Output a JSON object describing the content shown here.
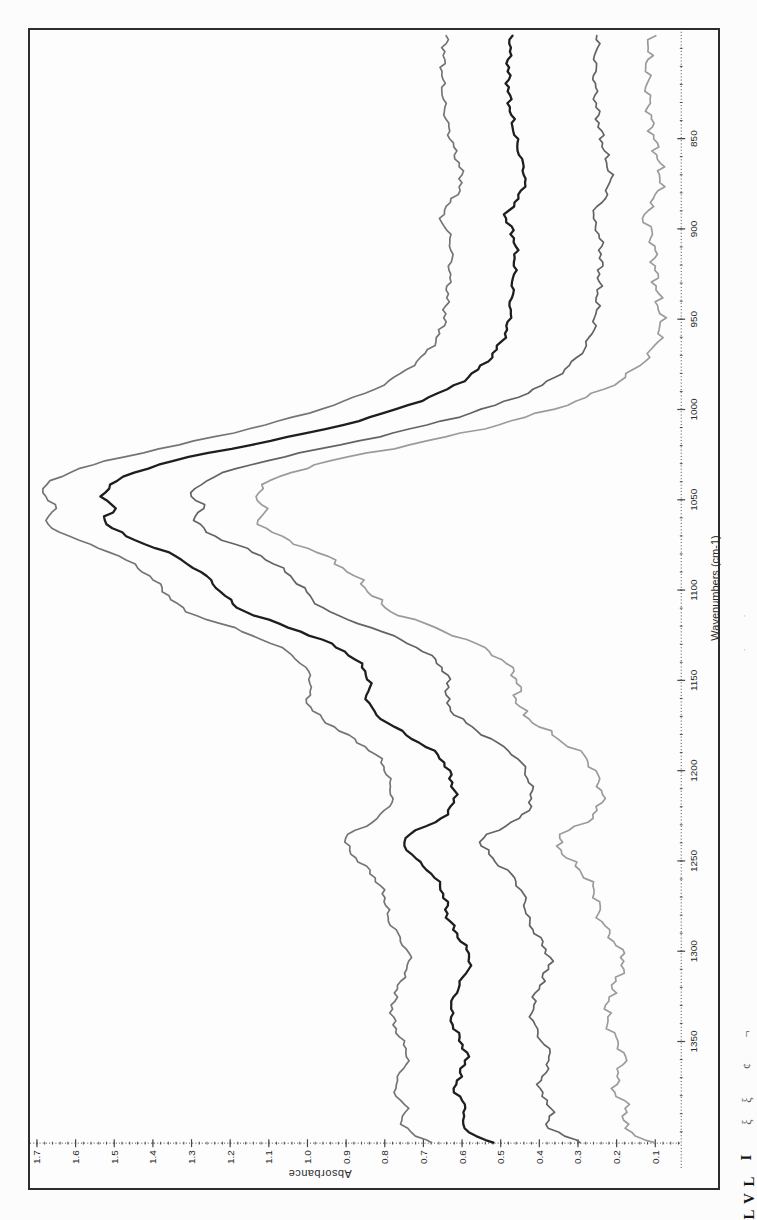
{
  "figure": {
    "border_color": "#2d2d2d",
    "axis_color": "#4a4a4a",
    "tick_label_color": "#2a2a2a"
  },
  "chart_data": {
    "type": "line",
    "title": "",
    "xlabel": "Wavenumbers (cm-1)",
    "ylabel": "Absorbance",
    "orientation": "figure rotated 90 degrees counter-clockwise on the page",
    "legend": "none",
    "grid": "off",
    "x_axis": {
      "direction_left_to_right": "decreasing wavenumber",
      "range_left_to_right": [
        1406,
        790
      ],
      "ticks": [
        850,
        900,
        950,
        1000,
        1050,
        1100,
        1150,
        1200,
        1250,
        1300,
        1350
      ],
      "tick_labels": [
        "850",
        "900",
        "950",
        "1000",
        "1050",
        "1100",
        "1150",
        "1200",
        "1250",
        "1300",
        "1350"
      ],
      "minor_tick_step": 10
    },
    "y_axis": {
      "range": [
        0.03,
        1.72
      ],
      "ticks": [
        0.1,
        0.2,
        0.3,
        0.4,
        0.5,
        0.6,
        0.7,
        0.8,
        0.9,
        1.0,
        1.1,
        1.2,
        1.3,
        1.4,
        1.5,
        1.6,
        1.7
      ],
      "tick_labels": [
        "0.1",
        "0.2",
        "0.3",
        "0.4",
        "0.5",
        "0.6",
        "0.7",
        "0.8",
        "0.9",
        "1.0",
        "1.1",
        "1.2",
        "1.3",
        "1.4",
        "1.5",
        "1.6",
        "1.7"
      ],
      "minor_tick_step": 0.02
    },
    "x": [
      793,
      810,
      828,
      845,
      862,
      872,
      882,
      893,
      900,
      910,
      925,
      940,
      955,
      968,
      978,
      988,
      998,
      1008,
      1018,
      1028,
      1038,
      1048,
      1054,
      1061,
      1070,
      1080,
      1092,
      1103,
      1112,
      1122,
      1132,
      1142,
      1152,
      1161,
      1170,
      1180,
      1192,
      1205,
      1218,
      1228,
      1237,
      1247,
      1258,
      1270,
      1282,
      1295,
      1305,
      1315,
      1326,
      1337,
      1348,
      1358,
      1368,
      1377,
      1387,
      1396,
      1402,
      1406
    ],
    "series": [
      {
        "name": "series-1",
        "color": "#757575",
        "stroke_width": 1.7,
        "values": [
          0.64,
          0.65,
          0.648,
          0.635,
          0.612,
          0.6,
          0.618,
          0.655,
          0.64,
          0.628,
          0.632,
          0.64,
          0.652,
          0.69,
          0.745,
          0.82,
          0.94,
          1.1,
          1.3,
          1.51,
          1.65,
          1.685,
          1.645,
          1.68,
          1.62,
          1.5,
          1.41,
          1.36,
          1.31,
          1.18,
          1.07,
          1.01,
          0.99,
          1.0,
          0.97,
          0.9,
          0.82,
          0.79,
          0.785,
          0.83,
          0.9,
          0.88,
          0.83,
          0.8,
          0.79,
          0.755,
          0.735,
          0.755,
          0.775,
          0.78,
          0.76,
          0.74,
          0.76,
          0.775,
          0.745,
          0.755,
          0.72,
          0.675
        ]
      },
      {
        "name": "series-2",
        "color": "#1e1e1e",
        "stroke_width": 2.3,
        "values": [
          0.472,
          0.48,
          0.478,
          0.466,
          0.447,
          0.437,
          0.452,
          0.487,
          0.473,
          0.462,
          0.466,
          0.473,
          0.483,
          0.515,
          0.56,
          0.63,
          0.745,
          0.9,
          1.11,
          1.34,
          1.48,
          1.53,
          1.498,
          1.525,
          1.47,
          1.355,
          1.265,
          1.215,
          1.16,
          1.03,
          0.92,
          0.86,
          0.84,
          0.845,
          0.815,
          0.745,
          0.66,
          0.628,
          0.622,
          0.665,
          0.748,
          0.728,
          0.675,
          0.645,
          0.635,
          0.6,
          0.578,
          0.598,
          0.622,
          0.628,
          0.608,
          0.588,
          0.605,
          0.618,
          0.59,
          0.6,
          0.565,
          0.525
        ]
      },
      {
        "name": "series-3",
        "color": "#636363",
        "stroke_width": 1.7,
        "values": [
          0.248,
          0.256,
          0.254,
          0.243,
          0.226,
          0.216,
          0.23,
          0.262,
          0.25,
          0.24,
          0.244,
          0.25,
          0.26,
          0.29,
          0.335,
          0.405,
          0.52,
          0.68,
          0.88,
          1.1,
          1.25,
          1.3,
          1.268,
          1.292,
          1.24,
          1.13,
          1.045,
          0.995,
          0.945,
          0.82,
          0.715,
          0.655,
          0.635,
          0.64,
          0.612,
          0.545,
          0.462,
          0.428,
          0.422,
          0.462,
          0.545,
          0.528,
          0.472,
          0.44,
          0.43,
          0.395,
          0.372,
          0.39,
          0.412,
          0.418,
          0.398,
          0.372,
          0.388,
          0.4,
          0.368,
          0.378,
          0.34,
          0.288
        ]
      },
      {
        "name": "series-4",
        "color": "#9b9b9b",
        "stroke_width": 1.7,
        "values": [
          0.112,
          0.12,
          0.118,
          0.108,
          0.092,
          0.085,
          0.098,
          0.128,
          0.115,
          0.104,
          0.1,
          0.092,
          0.085,
          0.11,
          0.155,
          0.225,
          0.34,
          0.5,
          0.7,
          0.93,
          1.08,
          1.135,
          1.105,
          1.128,
          1.075,
          0.965,
          0.88,
          0.83,
          0.78,
          0.655,
          0.545,
          0.48,
          0.455,
          0.458,
          0.432,
          0.368,
          0.285,
          0.248,
          0.24,
          0.278,
          0.35,
          0.332,
          0.282,
          0.252,
          0.242,
          0.205,
          0.18,
          0.198,
          0.218,
          0.225,
          0.205,
          0.18,
          0.195,
          0.205,
          0.172,
          0.182,
          0.148,
          0.102
        ]
      }
    ]
  },
  "page_edge_fragments": [
    {
      "glyph": "·",
      "top": 612,
      "cls": "f-speck"
    },
    {
      "glyph": "·",
      "top": 646,
      "cls": "f-speck"
    },
    {
      "glyph": "¬",
      "top": 1028,
      "cls": "f-light"
    },
    {
      "glyph": "¢",
      "top": 1060,
      "cls": "f-light"
    },
    {
      "glyph": "ξ",
      "top": 1094,
      "cls": "f-light"
    },
    {
      "glyph": "ξ",
      "top": 1116,
      "cls": "f-light"
    },
    {
      "glyph": "I",
      "top": 1150,
      "cls": "f-bold"
    },
    {
      "glyph": "L",
      "top": 1174,
      "cls": "f-bold"
    },
    {
      "glyph": "V",
      "top": 1191,
      "cls": "f-bold"
    },
    {
      "glyph": "L",
      "top": 1207,
      "cls": "f-bold"
    }
  ]
}
